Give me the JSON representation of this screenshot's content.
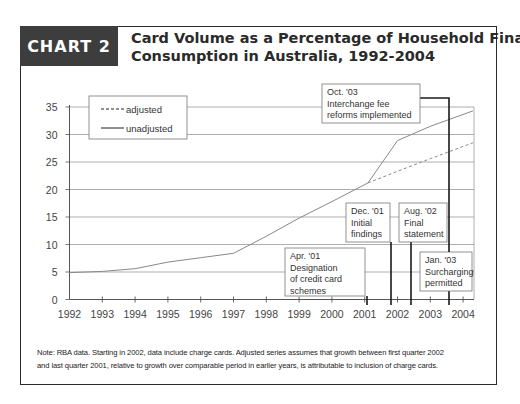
{
  "header": {
    "chart_label": "CHART 2",
    "title_line1": "Card Volume as a Percentage of Household Final",
    "title_line2": "Consumption in Australia, 1992-2004"
  },
  "note": {
    "line1": "Note: RBA data. Starting in 2002, data include charge cards. Adjusted series assumes that growth between first quarter 2002",
    "line2": "and last quarter 2001, relative to growth over comparable period in earlier years, is attributable to inclusion of charge cards."
  },
  "colors": {
    "label_bg": "#3d3d3d",
    "line": "#888888",
    "grid": "#9a9a9a",
    "annotation_line": "#1a1a1a"
  },
  "chart_data": {
    "type": "line",
    "title": "Card Volume as a Percentage of Household Final Consumption in Australia, 1992-2004",
    "xlabel": "",
    "ylabel": "",
    "x_ticks": [
      "1992",
      "1993",
      "1994",
      "1995",
      "1996",
      "1997",
      "1998",
      "1999",
      "2000",
      "2001",
      "2002",
      "2003",
      "2004"
    ],
    "y_ticks": [
      0,
      5,
      10,
      15,
      20,
      25,
      30,
      35
    ],
    "ylim": [
      0,
      35
    ],
    "xlim": [
      1992,
      2004.3
    ],
    "grid": true,
    "legend_position": "top-left",
    "legend": [
      "adjusted",
      "unadjusted"
    ],
    "series": [
      {
        "name": "unadjusted",
        "style": "solid",
        "x": [
          1992,
          1993,
          1994,
          1995,
          1996,
          1997,
          1998,
          1999,
          2000,
          2001.1,
          2002,
          2003,
          2004.3
        ],
        "values": [
          4.9,
          5.1,
          5.6,
          6.8,
          7.6,
          8.4,
          11.5,
          14.8,
          17.8,
          21.2,
          28.9,
          31.5,
          34.3
        ]
      },
      {
        "name": "adjusted",
        "style": "dashed",
        "x": [
          2001.1,
          2002,
          2003,
          2004.3
        ],
        "values": [
          21.2,
          23.3,
          25.6,
          28.5
        ]
      }
    ],
    "annotations": [
      {
        "date": "Apr. '01",
        "text": [
          "Apr. '01",
          "Designation",
          "of credit card",
          "schemes"
        ],
        "x": 2001.0
      },
      {
        "date": "Dec. '01",
        "text": [
          "Dec. '01",
          "Initial",
          "findings"
        ],
        "x": 2001.75
      },
      {
        "date": "Aug. '02",
        "text": [
          "Aug. '02",
          "Final",
          "statement"
        ],
        "x": 2002.4
      },
      {
        "date": "Jan. '03",
        "text": [
          "Jan. '03",
          "Surcharging",
          "permitted"
        ],
        "x": 2003.55
      },
      {
        "date": "Oct. '03",
        "text": [
          "Oct. '03",
          "Interchange fee",
          "reforms implemented"
        ],
        "x": 2003.6
      }
    ]
  }
}
